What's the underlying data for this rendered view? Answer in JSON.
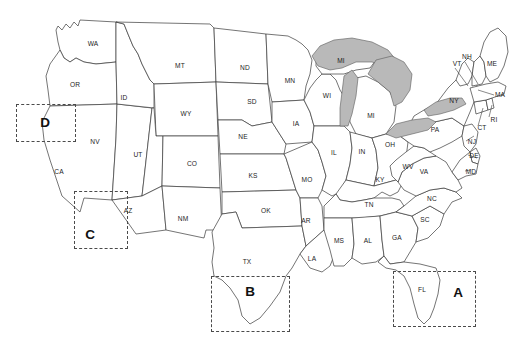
{
  "figure": {
    "background_color": "#ffffff",
    "state_fill_color": "#ffffff",
    "state_border_color": "#3a3a3a",
    "lake_fill_color": "#b9b9b9",
    "region_box_color": "#4a4a4a"
  },
  "states": [
    {
      "abbr": "WA",
      "x": 93,
      "y": 44
    },
    {
      "abbr": "OR",
      "x": 75,
      "y": 85
    },
    {
      "abbr": "CA",
      "x": 59,
      "y": 172
    },
    {
      "abbr": "NV",
      "x": 95,
      "y": 142
    },
    {
      "abbr": "ID",
      "x": 124,
      "y": 98
    },
    {
      "abbr": "MT",
      "x": 180,
      "y": 66
    },
    {
      "abbr": "WY",
      "x": 186,
      "y": 114
    },
    {
      "abbr": "UT",
      "x": 138,
      "y": 155
    },
    {
      "abbr": "AZ",
      "x": 128,
      "y": 211
    },
    {
      "abbr": "CO",
      "x": 192,
      "y": 164
    },
    {
      "abbr": "NM",
      "x": 183,
      "y": 219
    },
    {
      "abbr": "ND",
      "x": 245,
      "y": 68
    },
    {
      "abbr": "SD",
      "x": 252,
      "y": 102
    },
    {
      "abbr": "NE",
      "x": 243,
      "y": 137
    },
    {
      "abbr": "KS",
      "x": 253,
      "y": 176
    },
    {
      "abbr": "OK",
      "x": 266,
      "y": 211
    },
    {
      "abbr": "TX",
      "x": 247,
      "y": 262
    },
    {
      "abbr": "MN",
      "x": 290,
      "y": 81
    },
    {
      "abbr": "IA",
      "x": 296,
      "y": 124
    },
    {
      "abbr": "MO",
      "x": 307,
      "y": 180
    },
    {
      "abbr": "AR",
      "x": 306,
      "y": 221
    },
    {
      "abbr": "LA",
      "x": 312,
      "y": 259
    },
    {
      "abbr": "WI",
      "x": 327,
      "y": 96
    },
    {
      "abbr": "IL",
      "x": 334,
      "y": 153
    },
    {
      "abbr": "MS",
      "x": 339,
      "y": 241
    },
    {
      "abbr": "MI",
      "x": 341,
      "y": 61
    },
    {
      "abbr": "MI",
      "x": 371,
      "y": 116
    },
    {
      "abbr": "IN",
      "x": 362,
      "y": 152
    },
    {
      "abbr": "AL",
      "x": 368,
      "y": 241
    },
    {
      "abbr": "KY",
      "x": 380,
      "y": 180
    },
    {
      "abbr": "TN",
      "x": 369,
      "y": 205
    },
    {
      "abbr": "OH",
      "x": 390,
      "y": 145
    },
    {
      "abbr": "GA",
      "x": 397,
      "y": 238
    },
    {
      "abbr": "WV",
      "x": 408,
      "y": 167
    },
    {
      "abbr": "VA",
      "x": 424,
      "y": 172
    },
    {
      "abbr": "PA",
      "x": 435,
      "y": 130
    },
    {
      "abbr": "NY",
      "x": 454,
      "y": 101
    },
    {
      "abbr": "NC",
      "x": 432,
      "y": 199
    },
    {
      "abbr": "SC",
      "x": 425,
      "y": 220
    },
    {
      "abbr": "FL",
      "x": 422,
      "y": 290
    },
    {
      "abbr": "MD",
      "x": 471,
      "y": 172
    },
    {
      "abbr": "DE",
      "x": 474,
      "y": 156
    },
    {
      "abbr": "NJ",
      "x": 472,
      "y": 142
    },
    {
      "abbr": "CT",
      "x": 482,
      "y": 128
    },
    {
      "abbr": "RI",
      "x": 494,
      "y": 120
    },
    {
      "abbr": "MA",
      "x": 500,
      "y": 95
    },
    {
      "abbr": "NH",
      "x": 467,
      "y": 57
    },
    {
      "abbr": "VT",
      "x": 457,
      "y": 64
    },
    {
      "abbr": "ME",
      "x": 492,
      "y": 64
    }
  ],
  "regions": [
    {
      "letter": "A",
      "x": 393,
      "y": 271,
      "width": 83,
      "height": 56,
      "letter_x": 458,
      "letter_y": 293
    },
    {
      "letter": "B",
      "x": 211,
      "y": 276,
      "width": 79,
      "height": 56,
      "letter_x": 250,
      "letter_y": 292
    },
    {
      "letter": "C",
      "x": 74,
      "y": 191,
      "width": 54,
      "height": 58,
      "letter_x": 90,
      "letter_y": 235
    },
    {
      "letter": "D",
      "x": 16,
      "y": 104,
      "width": 60,
      "height": 38,
      "letter_x": 45,
      "letter_y": 123
    }
  ]
}
